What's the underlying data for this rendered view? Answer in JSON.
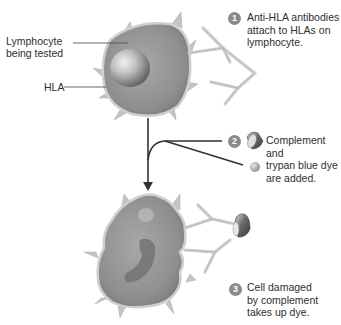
{
  "diagram": {
    "labels": {
      "lymphocyte": "Lymphocyte being tested",
      "lymphocyte_line1": "Lymphocyte",
      "lymphocyte_line2": "being tested",
      "hla": "HLA"
    },
    "steps": [
      {
        "number": "1",
        "lines": [
          "Anti-HLA antibodies",
          "attach to HLAs on",
          "lymphocyte."
        ]
      },
      {
        "number": "2",
        "lines": [
          "Complement",
          "and",
          "trypan blue dye",
          "are added."
        ]
      },
      {
        "number": "3",
        "lines": [
          "Cell damaged",
          "by complement",
          "takes up dye."
        ]
      }
    ],
    "icons": {
      "complement": "complement-cup-icon",
      "dye": "trypan-blue-dye-sphere-icon",
      "antibody": "y-shaped-antibody-icon"
    },
    "colors": {
      "badge": "#8a8a8a",
      "cell_fill": "#9a9a9a",
      "cell_edge": "#c8c8c8",
      "antibody": "#cfcfcf",
      "arrow": "#333333",
      "complement": "#5a5a5a"
    }
  }
}
